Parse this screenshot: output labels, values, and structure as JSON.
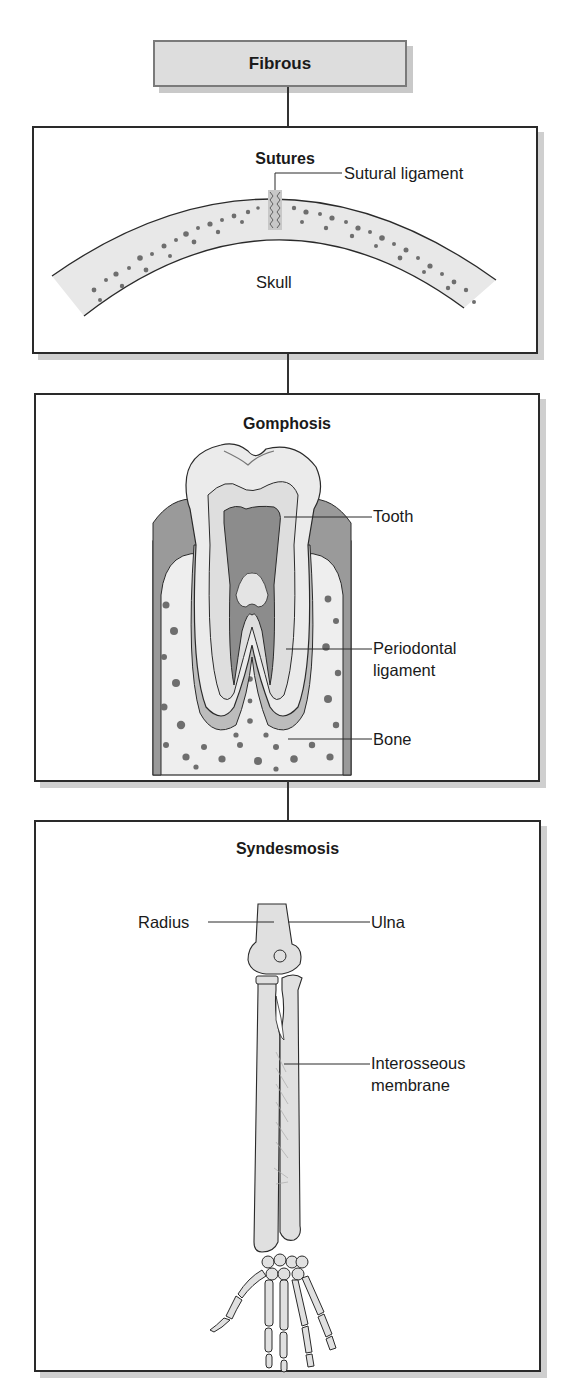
{
  "diagram": {
    "root": {
      "label": "Fibrous",
      "fill": "#dddddd",
      "border": "#7a7a7a"
    },
    "panels": [
      {
        "title": "Sutures",
        "labels": {
          "ligament": "Sutural ligament",
          "skull": "Skull"
        }
      },
      {
        "title": "Gomphosis",
        "labels": {
          "tooth": "Tooth",
          "periodontal_line1": "Periodontal",
          "periodontal_line2": "ligament",
          "bone": "Bone"
        }
      },
      {
        "title": "Syndesmosis",
        "labels": {
          "radius": "Radius",
          "ulna": "Ulna",
          "membrane_line1": "Interosseous",
          "membrane_line2": "membrane"
        }
      }
    ],
    "colors": {
      "bone_fill": "#e6e6e6",
      "spongy_spots": "#6e6e6e",
      "gum": "#9a9a9a",
      "pulp": "#8c8c8c",
      "outline": "#2a2a2a"
    }
  }
}
